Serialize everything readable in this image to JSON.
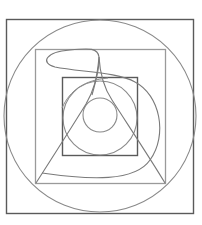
{
  "diagram": {
    "title": "",
    "width": 202,
    "height": 225,
    "colors": {
      "background": "#ffffff",
      "dark_stroke": "#5a5a5a",
      "light_stroke": "#9a9a9a",
      "curve_stroke": "#7a7a7a"
    },
    "shapes": {
      "outer_square": {
        "x": 6,
        "y": 19,
        "w": 187,
        "h": 194
      },
      "outer_circle": {
        "cx": 100,
        "cy": 116,
        "r": 96
      },
      "middle_square": {
        "x": 35,
        "y": 49,
        "w": 130,
        "h": 134
      },
      "inner_square": {
        "x": 62,
        "y": 77,
        "w": 75,
        "h": 78
      },
      "middle_circle": {
        "cx": 100,
        "cy": 118,
        "r": 37
      },
      "inner_circle": {
        "cx": 100,
        "cy": 115,
        "r": 17
      },
      "teardrop_triangle": {
        "apex": [
          99,
          57
        ],
        "base_left": [
          35,
          183
        ],
        "base_right": [
          165,
          183
        ]
      },
      "spiral_curve": {
        "start": [
          42,
          173
        ],
        "end": [
          99,
          57
        ]
      }
    }
  }
}
